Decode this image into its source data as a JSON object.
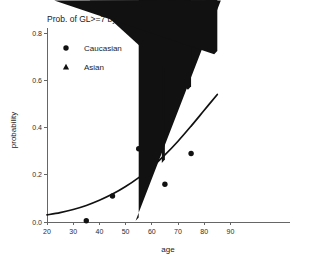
{
  "chart_data": {
    "type": "scatter",
    "title": "Prob. of GL>=7  by age",
    "xlabel": "age",
    "ylabel": "probability",
    "xlim": [
      20,
      90
    ],
    "ylim": [
      0.0,
      0.8
    ],
    "xticks": [
      "20",
      "30",
      "40",
      "50",
      "60",
      "70",
      "80",
      "90"
    ],
    "xtick_values": [
      20,
      30,
      40,
      50,
      60,
      70,
      80,
      90
    ],
    "yticks": [
      "0.0",
      "0.2",
      "0.4",
      "0.6",
      "0.8"
    ],
    "ytick_values": [
      0.0,
      0.2,
      0.4,
      0.6,
      0.8
    ],
    "grid": false,
    "legend_position": "upper-left-inside",
    "series": [
      {
        "name": "Caucasian",
        "marker": "circle",
        "color": "#111111",
        "points": [
          {
            "x": 35,
            "y": 0.005
          },
          {
            "x": 45,
            "y": 0.11
          },
          {
            "x": 55,
            "y": 0.31
          },
          {
            "x": 65,
            "y": 0.16
          },
          {
            "x": 75,
            "y": 0.29
          }
        ]
      },
      {
        "name": "Asian",
        "marker": "triangle",
        "color": "#111111",
        "points": [
          {
            "x": 55,
            "y": 0.005
          },
          {
            "x": 65,
            "y": 0.25
          },
          {
            "x": 75,
            "y": 0.56
          },
          {
            "x": 85,
            "y": 0.71
          }
        ]
      }
    ],
    "fit_curve": {
      "name": "fitted probability curve",
      "color": "#111111",
      "points": [
        {
          "x": 20,
          "y": 0.03
        },
        {
          "x": 25,
          "y": 0.04
        },
        {
          "x": 30,
          "y": 0.053
        },
        {
          "x": 35,
          "y": 0.07
        },
        {
          "x": 40,
          "y": 0.092
        },
        {
          "x": 45,
          "y": 0.118
        },
        {
          "x": 50,
          "y": 0.15
        },
        {
          "x": 55,
          "y": 0.188
        },
        {
          "x": 60,
          "y": 0.232
        },
        {
          "x": 65,
          "y": 0.284
        },
        {
          "x": 70,
          "y": 0.342
        },
        {
          "x": 75,
          "y": 0.406
        },
        {
          "x": 80,
          "y": 0.473
        },
        {
          "x": 85,
          "y": 0.54
        }
      ]
    },
    "legend": [
      {
        "label": "Caucasian",
        "marker": "circle"
      },
      {
        "label": "Asian",
        "marker": "triangle"
      }
    ]
  }
}
